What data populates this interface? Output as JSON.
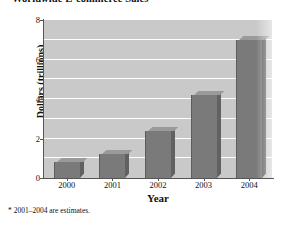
{
  "chart_data": {
    "type": "bar",
    "title": "Worldwide E-commerce Sales",
    "xlabel": "Year",
    "ylabel": "Dollars (trillions)",
    "categories": [
      "2000",
      "2001",
      "2002",
      "2003",
      "2004"
    ],
    "values": [
      0.8,
      1.2,
      2.4,
      4.2,
      7.0
    ],
    "ylim": [
      0,
      8
    ],
    "ytick_labels": [
      "0",
      "2",
      "4",
      "6",
      "8"
    ],
    "ytick_values": [
      0,
      2,
      4,
      6,
      8
    ],
    "gridline_values": [
      1,
      2,
      3,
      4,
      5,
      6,
      7,
      8
    ],
    "grid": true,
    "legend": "none",
    "annotations": [
      "* 2001–2004 are estimates."
    ],
    "style": {
      "bar_face_color": "#7a7a7a",
      "bar_top_color": "#9a9a9a",
      "bar_side_color": "#616161",
      "plot_background": "#c9c9c9",
      "gridline_color": "#ffffff",
      "axis_color": "#555555",
      "text_color": "#111111",
      "figure_background": "#ffffff"
    }
  },
  "footnote": {
    "text": "* 2001–2004 are estimates."
  }
}
